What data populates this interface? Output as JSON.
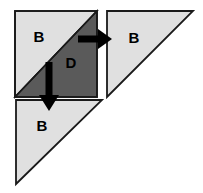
{
  "diagram": {
    "canvas": {
      "width": 203,
      "height": 193,
      "background": "#ffffff"
    },
    "colors": {
      "light_fill": "#e0e0e0",
      "dark_fill": "#5a5a5a",
      "stroke": "#1a1a1a",
      "arrow": "#000000",
      "label_text": "#000000"
    },
    "shapes": [
      {
        "id": "source-square",
        "name": "source-square",
        "kind": "square",
        "x": 15,
        "y": 11,
        "width": 82,
        "height": 86,
        "fill": "#e0e0e0",
        "stroke": "#1a1a1a"
      },
      {
        "id": "square-light-triangle",
        "name": "square-upper-left-triangle",
        "kind": "triangle",
        "label": "B",
        "label_x": 39,
        "label_y": 38,
        "points": "15,11 97,11 15,97",
        "fill": "#e0e0e0",
        "stroke": "#1a1a1a"
      },
      {
        "id": "square-dark-triangle",
        "name": "square-lower-right-triangle",
        "kind": "triangle",
        "label": "D",
        "label_x": 71,
        "label_y": 64,
        "points": "97,11 97,97 15,97",
        "fill": "#5a5a5a",
        "stroke": "#1a1a1a"
      },
      {
        "id": "right-triangle",
        "name": "right-output-triangle",
        "kind": "triangle",
        "label": "B",
        "label_x": 134,
        "label_y": 39,
        "points": "107,11 193,11 107,97",
        "fill": "#e0e0e0",
        "stroke": "#1a1a1a"
      },
      {
        "id": "bottom-triangle",
        "name": "bottom-output-triangle",
        "kind": "triangle",
        "label": "B",
        "label_x": 42,
        "label_y": 127,
        "points": "16,100 102,100 16,184",
        "fill": "#e0e0e0",
        "stroke": "#1a1a1a"
      }
    ],
    "arrows": [
      {
        "id": "arrow-right",
        "name": "arrow-right",
        "direction": "right",
        "from_x": 78,
        "from_y": 39,
        "to_x": 112,
        "to_y": 39,
        "color": "#000000",
        "shaft_width": 7
      },
      {
        "id": "arrow-down",
        "name": "arrow-down",
        "direction": "down",
        "from_x": 49,
        "from_y": 62,
        "to_x": 49,
        "to_y": 111,
        "color": "#000000",
        "shaft_width": 7
      }
    ],
    "labels": [
      {
        "id": "label-b-square",
        "text": "B",
        "x": 39,
        "y": 38
      },
      {
        "id": "label-d-square",
        "text": "D",
        "x": 71,
        "y": 64
      },
      {
        "id": "label-b-right",
        "text": "B",
        "x": 134,
        "y": 39
      },
      {
        "id": "label-b-bottom",
        "text": "B",
        "x": 42,
        "y": 127
      }
    ]
  }
}
